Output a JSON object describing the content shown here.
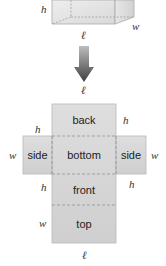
{
  "figure": {
    "box": {
      "labels": {
        "height": "h",
        "width": "w",
        "length": "ℓ"
      }
    },
    "arrow": {
      "label": "ℓ"
    },
    "net": {
      "panels": {
        "back": "back",
        "bottom": "bottom",
        "side_left": "side",
        "side_right": "side",
        "front": "front",
        "top": "top"
      },
      "labels": {
        "back_right_h": "h",
        "left_side_top_h": "h",
        "left_w": "w",
        "right_w": "w",
        "front_left_h": "h",
        "front_right_h": "h",
        "top_left_w": "w",
        "bottom_l": "ℓ"
      }
    },
    "colors": {
      "panel_fill": "#d6d6d6",
      "panel_border": "#b5b5b5",
      "fold_line": "#8a8a8a",
      "arrow_top": "#bdbdbd",
      "arrow_bottom": "#4a4a4a"
    }
  }
}
